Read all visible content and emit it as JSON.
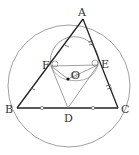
{
  "diagram": {
    "type": "geometry",
    "labels": {
      "A": "A",
      "B": "B",
      "C": "C",
      "D": "D",
      "E": "E",
      "F": "F",
      "O": "O"
    },
    "points": {
      "A": [
        83,
        19
      ],
      "B": [
        17,
        108
      ],
      "C": [
        118,
        108
      ],
      "D": [
        68,
        108
      ],
      "E": [
        98,
        65
      ],
      "F": [
        51,
        66
      ],
      "O": [
        68,
        79
      ]
    },
    "colors": {
      "line": "#333333",
      "thin": "#777777",
      "background": "#ffffff"
    }
  }
}
